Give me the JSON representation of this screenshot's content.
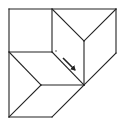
{
  "diagram": {
    "type": "geometric-fold-diagram",
    "stroke_color": "#222222",
    "background": "#ffffff",
    "stroke_width": 1.1,
    "segments": [
      {
        "name": "outer-left-edge",
        "x1": 9,
        "y1": 9,
        "x2": 9,
        "y2": 117
      },
      {
        "name": "outer-top-edge",
        "x1": 9,
        "y1": 9,
        "x2": 116,
        "y2": 9
      },
      {
        "name": "outer-right-edge",
        "x1": 116,
        "y1": 9,
        "x2": 116,
        "y2": 53
      },
      {
        "name": "outer-right-diagonal",
        "x1": 116,
        "y1": 53,
        "x2": 84,
        "y2": 85
      },
      {
        "name": "outer-bottom-diagonal",
        "x1": 84,
        "y1": 85,
        "x2": 52,
        "y2": 117
      },
      {
        "name": "outer-bottom-edge",
        "x1": 9,
        "y1": 117,
        "x2": 52,
        "y2": 117
      },
      {
        "name": "square-right-edge",
        "x1": 52,
        "y1": 9,
        "x2": 52,
        "y2": 52
      },
      {
        "name": "square-bottom-edge",
        "x1": 9,
        "y1": 52,
        "x2": 52,
        "y2": 52
      },
      {
        "name": "top-crease-left",
        "x1": 52,
        "y1": 9,
        "x2": 84,
        "y2": 41
      },
      {
        "name": "top-crease-right",
        "x1": 116,
        "y1": 9,
        "x2": 84,
        "y2": 41
      },
      {
        "name": "center-vertical",
        "x1": 84,
        "y1": 41,
        "x2": 84,
        "y2": 85
      },
      {
        "name": "center-diagonal",
        "x1": 52,
        "y1": 52,
        "x2": 84,
        "y2": 85
      },
      {
        "name": "left-crease-upper",
        "x1": 9,
        "y1": 52,
        "x2": 41,
        "y2": 85
      },
      {
        "name": "middle-horizontal",
        "x1": 41,
        "y1": 85,
        "x2": 84,
        "y2": 85
      },
      {
        "name": "left-crease-lower",
        "x1": 41,
        "y1": 85,
        "x2": 9,
        "y2": 117
      }
    ],
    "arrow": {
      "name": "fold-direction-arrow",
      "x1": 63,
      "y1": 58,
      "x2": 75,
      "y2": 70
    },
    "dot": {
      "name": "reference-dot",
      "cx": 56,
      "cy": 51,
      "r": 0.7
    }
  }
}
